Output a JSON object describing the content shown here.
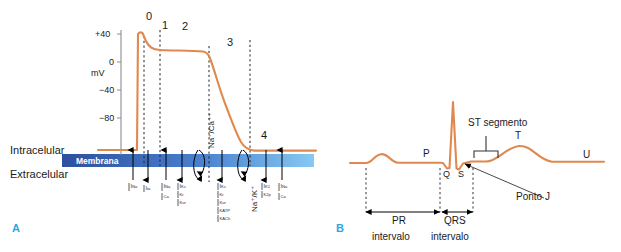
{
  "figure": {
    "panels": [
      {
        "tag": "A",
        "tag_color": "#2ba8e0"
      },
      {
        "tag": "B",
        "tag_color": "#2ba8e0"
      }
    ],
    "trace_color": "#e0894f",
    "membrane_color_dark": "#2c4f9e",
    "membrane_color_light": "#7fc4ef"
  },
  "panel_a": {
    "y_axis": {
      "unit": "mV",
      "ticks": [
        "+40",
        "0",
        "−40",
        "−80"
      ]
    },
    "phases": [
      {
        "label": "0"
      },
      {
        "label": "1"
      },
      {
        "label": "2"
      },
      {
        "label": "3"
      },
      {
        "label": "4"
      }
    ],
    "compartments": {
      "top": "Intracelular",
      "membrane": "Membrana",
      "bottom": "Extracelular"
    },
    "exchangers": [
      {
        "label": "Na⁺/Ca⁺⁺"
      },
      {
        "label": "Na⁺/K⁺"
      }
    ],
    "currents": [
      {
        "group": [
          "I Na"
        ],
        "direction": "inward"
      },
      {
        "group": [
          "I to"
        ],
        "direction": "outward"
      },
      {
        "group": [
          "I Na",
          "Ca"
        ],
        "direction": "inward"
      },
      {
        "group": [
          "I Ks",
          "Kr",
          "Kur"
        ],
        "direction": "outward"
      },
      {
        "group": [
          "I Ks",
          "Kr",
          "Kur",
          "KATP",
          "KACh"
        ],
        "direction": "outward"
      },
      {
        "group": [
          "I K1",
          "K2p"
        ],
        "direction": "outward"
      },
      {
        "group": [
          "I Na",
          "Ca"
        ],
        "direction": "inward"
      }
    ],
    "current_labels": {
      "na": "Na",
      "to": "to",
      "ca": "Ca",
      "ks": "Ks",
      "kr": "Kr",
      "kur": "Kur",
      "katp": "KATP",
      "kach": "KACh",
      "k1": "K1",
      "k2p": "K2p",
      "i": "I"
    }
  },
  "panel_b": {
    "waves": [
      {
        "label": "P"
      },
      {
        "label": "Q"
      },
      {
        "label": "S"
      },
      {
        "label": "T"
      },
      {
        "label": "U"
      }
    ],
    "annotations": {
      "st_segment": "ST segmento",
      "ponto_j": "Ponto J"
    },
    "intervals": [
      {
        "name": "PR",
        "unit": "intervalo"
      },
      {
        "name": "QRS",
        "unit": "intervalo"
      }
    ]
  }
}
